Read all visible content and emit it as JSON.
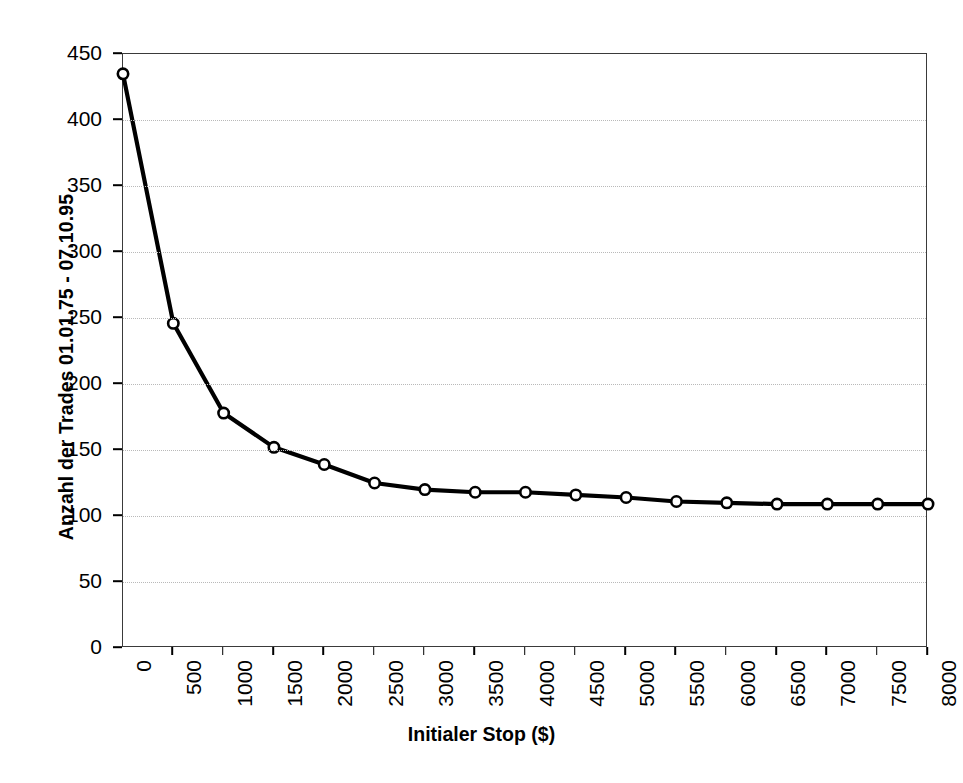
{
  "chart_data": {
    "type": "line",
    "title": "",
    "xlabel": "Initialer Stop ($)",
    "ylabel": "Anzahl der Trades 01.01.75 - 07.10.95",
    "x": [
      0,
      500,
      1000,
      1500,
      2000,
      2500,
      3000,
      3500,
      4000,
      4500,
      5000,
      5500,
      6000,
      6500,
      7000,
      7500,
      8000
    ],
    "categories": [
      "0",
      "500",
      "1000",
      "1500",
      "2000",
      "2500",
      "3000",
      "3500",
      "4000",
      "4500",
      "5000",
      "5500",
      "6000",
      "6500",
      "7000",
      "7500",
      "8000"
    ],
    "values": [
      435,
      246,
      178,
      152,
      139,
      125,
      120,
      118,
      118,
      116,
      114,
      111,
      110,
      109,
      109,
      109,
      109
    ],
    "series": [
      {
        "name": "Anzahl der Trades",
        "values": [
          435,
          246,
          178,
          152,
          139,
          125,
          120,
          118,
          118,
          116,
          114,
          111,
          110,
          109,
          109,
          109,
          109
        ]
      }
    ],
    "ylim": [
      0,
      450
    ],
    "ytick_values": [
      0,
      50,
      100,
      150,
      200,
      250,
      300,
      350,
      400,
      450
    ],
    "ytick_labels": [
      "0",
      "50",
      "100",
      "150",
      "200",
      "250",
      "300",
      "350",
      "400",
      "450"
    ],
    "xlim": [
      0,
      8000
    ],
    "xtick_step": 500,
    "grid": "horizontal-dotted",
    "legend": "none",
    "marker": "open-circle",
    "line_color": "#000000",
    "marker_fill": "#ffffff",
    "marker_edge": "#000000",
    "grid_color": "#b9b9b9",
    "frame_color": "#3a3a3a",
    "background": "#ffffff"
  }
}
